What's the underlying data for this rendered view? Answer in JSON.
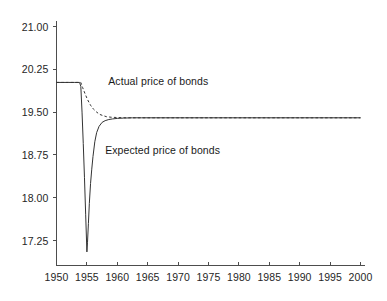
{
  "chart_data": {
    "type": "line",
    "title": "",
    "subtitle": "",
    "xlabel": "",
    "ylabel": "",
    "xlim": [
      1950,
      2000
    ],
    "ylim": [
      17.0,
      21.15
    ],
    "grid": false,
    "legend_position": "inline-annotations",
    "x_ticks": [
      1950,
      1955,
      1960,
      1965,
      1970,
      1975,
      1980,
      1985,
      1990,
      1995,
      2000
    ],
    "x_tick_labels": [
      "1950",
      "1955",
      "1960",
      "1965",
      "1970",
      "1975",
      "1980",
      "1985",
      "1990",
      "1995",
      "2000"
    ],
    "y_ticks": [
      17.25,
      18.0,
      18.75,
      19.5,
      20.25,
      21.0
    ],
    "y_tick_labels": [
      "17.25",
      "18.00",
      "18.75",
      "19.50",
      "20.25",
      "21.00"
    ],
    "series": [
      {
        "name": "Expected price of bonds",
        "style": "solid",
        "color": "#333333",
        "annotation_x": 1958.0,
        "annotation_y": 18.82,
        "x": [
          1950.0,
          1951.0,
          1952.0,
          1953.0,
          1953.8,
          1954.0,
          1954.2,
          1954.4,
          1954.6,
          1954.8,
          1955.0,
          1955.1,
          1955.25,
          1955.4,
          1955.6,
          1955.8,
          1956.0,
          1956.3,
          1956.6,
          1957.0,
          1957.5,
          1958.0,
          1958.6,
          1959.2,
          1960.0,
          1961.0,
          1962.5,
          1964.0,
          1966.0,
          1968.0,
          1971.0,
          1975.0,
          1980.0,
          1985.0,
          1990.0,
          1995.0,
          2000.0
        ],
        "y": [
          20.02,
          20.02,
          20.02,
          20.02,
          20.02,
          19.95,
          19.5,
          18.95,
          18.35,
          17.7,
          17.05,
          17.22,
          17.55,
          17.9,
          18.25,
          18.5,
          18.72,
          18.98,
          19.14,
          19.25,
          19.32,
          19.35,
          19.37,
          19.38,
          19.39,
          19.395,
          19.4,
          19.4,
          19.4,
          19.4,
          19.4,
          19.4,
          19.4,
          19.4,
          19.4,
          19.4,
          19.4
        ]
      },
      {
        "name": "Actual price of bonds",
        "style": "dashed",
        "color": "#333333",
        "annotation_x": 1958.5,
        "annotation_y": 20.02,
        "x": [
          1950.0,
          1952.0,
          1954.0,
          1954.3,
          1954.7,
          1955.1,
          1955.6,
          1956.1,
          1956.6,
          1957.1,
          1957.6,
          1958.2,
          1959.0,
          1960.0,
          1961.5,
          1963.0,
          1965.0,
          1968.0,
          1972.0,
          1978.0,
          1985.0,
          1992.0,
          2000.0
        ],
        "y": [
          20.02,
          20.02,
          20.02,
          19.93,
          19.82,
          19.72,
          19.62,
          19.55,
          19.5,
          19.46,
          19.44,
          19.42,
          19.41,
          19.405,
          19.4,
          19.4,
          19.4,
          19.4,
          19.4,
          19.4,
          19.4,
          19.4,
          19.4
        ]
      }
    ],
    "annotations": [
      {
        "text": "Actual price of bonds",
        "x": 1958.5,
        "y": 20.02
      },
      {
        "text": "Expected price of bonds",
        "x": 1958.0,
        "y": 18.82
      }
    ],
    "colors": {
      "axis": "#4d4d4d",
      "line": "#333333",
      "text": "#262626",
      "background": "#ffffff"
    }
  }
}
